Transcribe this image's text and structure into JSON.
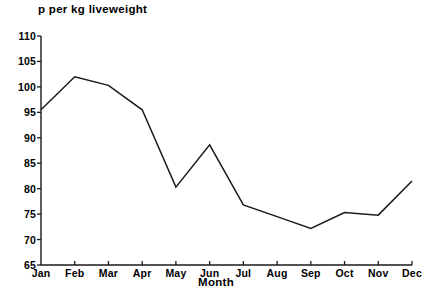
{
  "chart_data": {
    "type": "line",
    "title": "p per kg liveweight",
    "xlabel": "Month",
    "ylabel": "",
    "categories": [
      "Jan",
      "Feb",
      "Mar",
      "Apr",
      "May",
      "Jun",
      "Jul",
      "Aug",
      "Sep",
      "Oct",
      "Nov",
      "Dec"
    ],
    "values": [
      95.5,
      102.0,
      100.3,
      95.5,
      80.3,
      88.6,
      76.8,
      74.5,
      72.2,
      75.3,
      74.8,
      81.5
    ],
    "series": [
      {
        "name": "p per kg liveweight",
        "values": [
          95.5,
          102.0,
          100.3,
          95.5,
          80.3,
          88.6,
          76.8,
          74.5,
          72.2,
          75.3,
          74.8,
          81.5
        ]
      }
    ],
    "ylim": [
      65,
      110
    ],
    "yticks": [
      65,
      70,
      75,
      80,
      85,
      90,
      95,
      100,
      105,
      110
    ],
    "ytick_labels": [
      "65",
      "70",
      "75",
      "80",
      "85",
      "90",
      "95",
      "100",
      "105",
      "110"
    ],
    "xtick_labels": [
      "Jan",
      "Feb",
      "Mar",
      "Apr",
      "May",
      "Jun",
      "Jul",
      "Aug",
      "Sep",
      "Oct",
      "Nov",
      "Dec"
    ],
    "grid": false,
    "legend": false,
    "legend_position": "none",
    "line_color": "#1a1a1a",
    "axis_color": "#1a1a1a",
    "background_color": "#ffffff"
  }
}
